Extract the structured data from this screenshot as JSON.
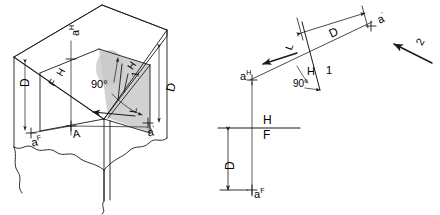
{
  "figure": {
    "background_color": "#ffffff",
    "line_color": "#1a1a1a",
    "shade_color": "#c9c9c9"
  },
  "pictorial": {
    "name": "cube-pictorial-view",
    "labels": {
      "point_a_h": "a",
      "point_a_h_sup": "H",
      "point_a_f": "a",
      "point_a_f_sup": "F",
      "point_a_prime": "a",
      "point_a_prime_sup": "'",
      "depth_left": "D",
      "depth_right": "D",
      "fold_h": "H",
      "fold_f": "F",
      "angle": "90°",
      "fold_h_aux": "H",
      "fold_1_aux": "1",
      "plane_a": "A",
      "true_length": "L"
    }
  },
  "orthographic": {
    "name": "orthographic-multiview",
    "labels": {
      "point_a_h": "a",
      "point_a_h_sup": "H",
      "point_a_f": "a",
      "point_a_f_sup": "F",
      "point_a_prime": "a",
      "point_a_prime_sup": "'",
      "dim_d_aux": "D",
      "dim_d_front": "D",
      "fold_h": "H",
      "fold_f": "F",
      "fold_h_aux": "H",
      "fold_1_aux": "1",
      "angle": "90°",
      "true_length": "L",
      "direction_arrow": "2"
    }
  }
}
